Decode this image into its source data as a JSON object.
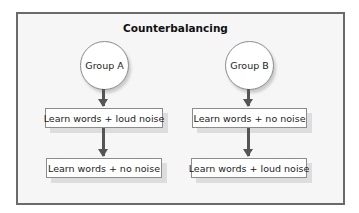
{
  "diagram": {
    "title": "Counterbalancing",
    "groups": [
      {
        "label": "Group A",
        "steps": [
          "Learn words + loud noise",
          "Learn words + no noise"
        ]
      },
      {
        "label": "Group B",
        "steps": [
          "Learn words + no noise",
          "Learn words + loud noise"
        ]
      }
    ]
  }
}
